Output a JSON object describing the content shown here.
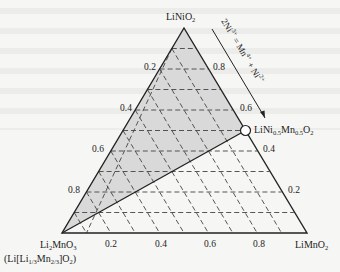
{
  "diagram": {
    "type": "ternary-phase-diagram",
    "vertices": {
      "top": {
        "formula": "LiNiO",
        "sub": "2"
      },
      "bottom_left": {
        "formula": "Li",
        "sub1": "2",
        "mid": "MnO",
        "sub2": "3",
        "alt_open": "(Li[Li",
        "alt_sub1": "1/3",
        "alt_mid": "Mn",
        "alt_sub2": "2/3",
        "alt_close": "]O",
        "alt_sub3": "2",
        "alt_end": ")"
      },
      "bottom_right": {
        "formula": "LiMnO",
        "sub": "2"
      }
    },
    "point": {
      "prefix": "LiNi",
      "sub1": "0.5",
      "mid": "Mn",
      "sub2": "0.5",
      "suffix": "O",
      "sub3": "2"
    },
    "arrow_label": {
      "a": "2Ni",
      "a_sup": "3+",
      "eq": " = Mn",
      "b_sup": "4+",
      "plus": " + Ni",
      "c_sup": "2+"
    },
    "left_ticks": [
      "0.2",
      "0.4",
      "0.6",
      "0.8"
    ],
    "right_ticks": [
      "0.8",
      "0.6",
      "0.4",
      "0.2"
    ],
    "bottom_ticks": [
      "0.2",
      "0.4",
      "0.6",
      "0.8"
    ],
    "colors": {
      "shade": "#d9d9d9",
      "line": "#222222",
      "dash": "#444444"
    }
  }
}
